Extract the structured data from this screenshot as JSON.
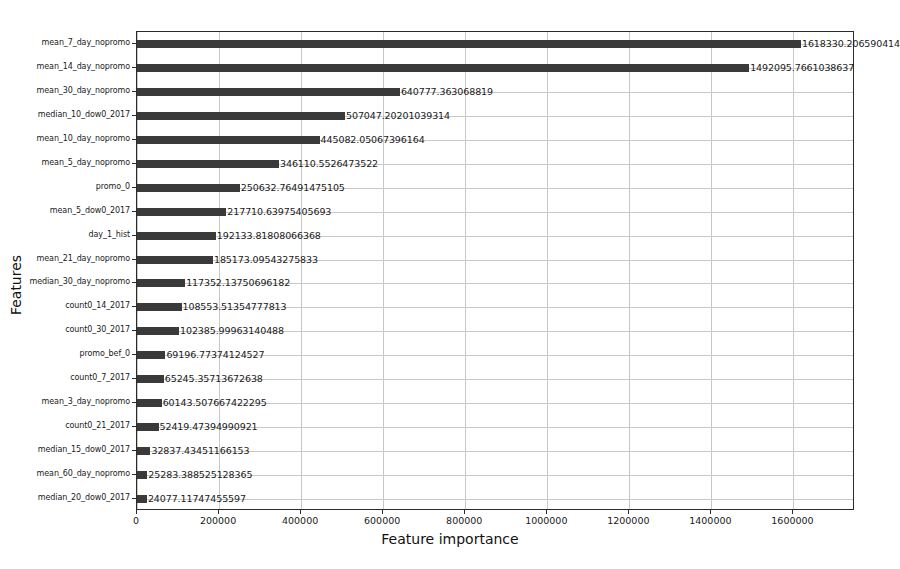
{
  "chart_data": {
    "type": "bar",
    "orientation": "horizontal",
    "title": "",
    "xlabel": "Feature importance",
    "ylabel": "Features",
    "xlim": [
      0,
      1750000
    ],
    "grid": true,
    "legend": null,
    "xticks": [
      0,
      200000,
      400000,
      600000,
      800000,
      1000000,
      1200000,
      1400000,
      1600000
    ],
    "xtick_labels": [
      "0",
      "200000",
      "400000",
      "600000",
      "800000",
      "1000000",
      "1200000",
      "1400000",
      "1600000"
    ],
    "bar_color": "#3a3a3a",
    "categories": [
      "mean_7_day_nopromo",
      "mean_14_day_nopromo",
      "mean_30_day_nopromo",
      "median_10_dow0_2017",
      "mean_10_day_nopromo",
      "mean_5_day_nopromo",
      "promo_0",
      "mean_5_dow0_2017",
      "day_1_hist",
      "mean_21_day_nopromo",
      "median_30_day_nopromo",
      "count0_14_2017",
      "count0_30_2017",
      "promo_bef_0",
      "count0_7_2017",
      "mean_3_day_nopromo",
      "count0_21_2017",
      "median_15_dow0_2017",
      "mean_60_day_nopromo",
      "median_20_dow0_2017"
    ],
    "values": [
      1618330.206590414,
      1492095.7661038637,
      640777.363068819,
      507047.20201039314,
      445082.05067396164,
      346110.5526473522,
      250632.76491475105,
      217710.63975405693,
      192133.81808066368,
      185173.09543275833,
      117352.13750696182,
      108553.51354777813,
      102385.99963140488,
      69196.77374124527,
      65245.35713672638,
      60143.507667422295,
      52419.47394990921,
      32837.43451166153,
      25283.388525128365,
      24077.11747455597
    ],
    "value_labels": [
      "1618330.206590414",
      "1492095.7661038637",
      "640777.363068819",
      "507047.20201039314",
      "445082.05067396164",
      "346110.5526473522",
      "250632.76491475105",
      "217710.63975405693",
      "192133.81808066368",
      "185173.09543275833",
      "117352.13750696182",
      "108553.51354777813",
      "102385.99963140488",
      "69196.77374124527",
      "65245.35713672638",
      "60143.507667422295",
      "52419.47394990921",
      "32837.43451166153",
      "25283.388525128365",
      "24077.11747455597"
    ]
  }
}
